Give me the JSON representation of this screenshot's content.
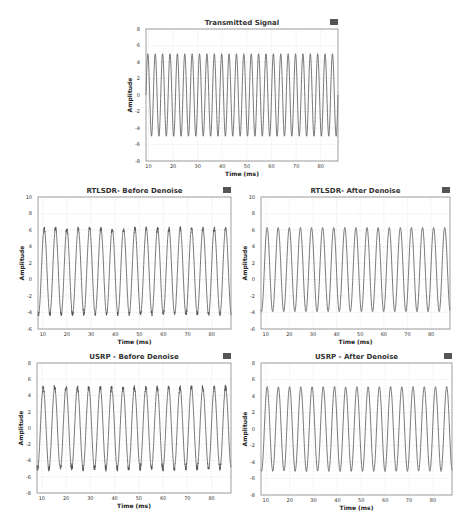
{
  "chart_data": [
    {
      "id": "transmitted",
      "type": "line",
      "title": "Transmitted Signal",
      "xlabel": "Time (ms)",
      "ylabel": "Amplitude",
      "xlim": [
        9,
        87
      ],
      "ylim": [
        -8,
        8
      ],
      "xticks": [
        10,
        20,
        30,
        40,
        50,
        60,
        70,
        80
      ],
      "yticks": [
        -8,
        -6,
        -4,
        -2,
        0,
        2,
        4,
        6,
        8
      ],
      "grid": true,
      "legend": "none",
      "series": [
        {
          "name": "signal",
          "amplitude": 5,
          "offset": 0,
          "period_ms": 3.0,
          "noise": 0
        }
      ],
      "frame": {
        "left": 146,
        "top": 29,
        "width": 192,
        "height": 132
      }
    },
    {
      "id": "rtlsdr-before",
      "type": "line",
      "title": "RTLSDR- Before Denoise",
      "xlabel": "Time (ms)",
      "ylabel": "Amplitude",
      "xlim": [
        8,
        88
      ],
      "ylim": [
        -6,
        10
      ],
      "xticks": [
        10,
        20,
        30,
        40,
        50,
        60,
        70,
        80
      ],
      "yticks": [
        -6,
        -4,
        -2,
        0,
        2,
        4,
        6,
        8,
        10
      ],
      "grid": true,
      "legend": "none",
      "series": [
        {
          "name": "signal",
          "amplitude": 5.2,
          "offset": 1.0,
          "period_ms": 4.7,
          "noise": 0.25,
          "peak_range": [
            6.0,
            6.5
          ],
          "trough_range": [
            -4.0,
            -4.3
          ]
        }
      ],
      "frame": {
        "left": 38,
        "top": 197,
        "width": 193,
        "height": 132
      }
    },
    {
      "id": "rtlsdr-after",
      "type": "line",
      "title": "RTLSDR- After Denoise",
      "xlabel": "Time (ms)",
      "ylabel": "Amplitude",
      "xlim": [
        8,
        88
      ],
      "ylim": [
        -6,
        10
      ],
      "xticks": [
        10,
        20,
        30,
        40,
        50,
        60,
        70,
        80
      ],
      "yticks": [
        -6,
        -4,
        -2,
        0,
        2,
        4,
        6,
        8,
        10
      ],
      "grid": true,
      "legend": "none",
      "series": [
        {
          "name": "signal",
          "amplitude": 5.1,
          "offset": 1.2,
          "period_ms": 4.7,
          "noise": 0,
          "peak_range": [
            6.2,
            6.4
          ],
          "trough_range": [
            -3.9,
            -3.9
          ]
        }
      ],
      "frame": {
        "left": 261,
        "top": 197,
        "width": 189,
        "height": 132
      }
    },
    {
      "id": "usrp-before",
      "type": "line",
      "title": "USRP - Before Denoise",
      "xlabel": "Time (ms)",
      "ylabel": "Amplitude",
      "xlim": [
        8,
        88
      ],
      "ylim": [
        -8,
        8
      ],
      "xticks": [
        10,
        20,
        30,
        40,
        50,
        60,
        70,
        80
      ],
      "yticks": [
        -8,
        -6,
        -4,
        -2,
        0,
        2,
        4,
        6,
        8
      ],
      "grid": true,
      "legend": "none",
      "series": [
        {
          "name": "signal",
          "amplitude": 5,
          "offset": 0,
          "period_ms": 4.7,
          "noise": 0.35,
          "peak_range": [
            4.8,
            5.5
          ],
          "trough_range": [
            -5.0,
            -5.6
          ]
        }
      ],
      "frame": {
        "left": 37,
        "top": 363,
        "width": 194,
        "height": 130
      }
    },
    {
      "id": "usrp-after",
      "type": "line",
      "title": "USRP - After Denoise",
      "xlabel": "Time (ms)",
      "ylabel": "Amplitude",
      "xlim": [
        8,
        88
      ],
      "ylim": [
        -8,
        8
      ],
      "xticks": [
        10,
        20,
        30,
        40,
        50,
        60,
        70,
        80
      ],
      "yticks": [
        -8,
        -6,
        -4,
        -2,
        0,
        2,
        4,
        6,
        8
      ],
      "grid": true,
      "legend": "none",
      "series": [
        {
          "name": "signal",
          "amplitude": 5.1,
          "offset": 0,
          "period_ms": 4.7,
          "noise": 0.05,
          "peak_range": [
            4.8,
            5.1
          ],
          "trough_range": [
            -5.0,
            -5.3
          ]
        }
      ],
      "frame": {
        "left": 261,
        "top": 363,
        "width": 191,
        "height": 132
      }
    }
  ],
  "colors": {
    "line": "#555555",
    "grid": "#d8d8d8",
    "frame": "#888888",
    "icon": "#555555"
  },
  "icon": "menu-square-icon"
}
